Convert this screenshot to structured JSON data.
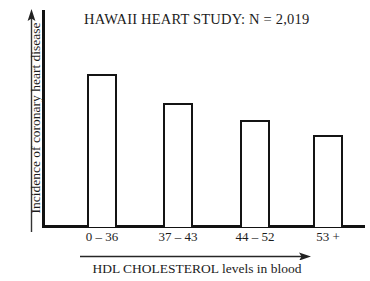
{
  "chart_data": {
    "type": "bar",
    "title": "HAWAII HEART STUDY: N  =  2,019",
    "xlabel": "HDL CHOLESTEROL levels in blood",
    "ylabel": "Incidence of coronary heart disease",
    "categories": [
      "0 – 36",
      "37 – 43",
      "44 – 52",
      "53 +"
    ],
    "values": [
      153,
      124,
      107,
      92
    ],
    "value_unit": "relative incidence (unlabeled axis)",
    "ylim": [
      0,
      218
    ],
    "grid": false,
    "legend": null,
    "y_axis_ticks": [],
    "x_axis_ticks": [
      "0 – 36",
      "37 – 43",
      "44 – 52",
      "53 +"
    ],
    "annotations": [
      "y-axis drawn as an upward arrow (increasing incidence)",
      "x-axis caption underlined by a right-pointing arrow (increasing HDL)"
    ],
    "bar_style": {
      "fill": "#ffffff",
      "stroke": "#141414",
      "stroke_width": 2,
      "bar_width_px": 30
    },
    "bars": [
      {
        "category": "0 – 36",
        "value": 153,
        "x": 87,
        "top": 74,
        "width": 30,
        "height": 153
      },
      {
        "category": "37 – 43",
        "value": 124,
        "x": 163,
        "top": 103,
        "width": 30,
        "height": 124
      },
      {
        "category": "44 – 52",
        "value": 107,
        "x": 240,
        "top": 120,
        "width": 30,
        "height": 107
      },
      {
        "category": "53 +",
        "value": 92,
        "x": 313,
        "top": 135,
        "width": 30,
        "height": 92
      }
    ]
  },
  "colors": {
    "background": "#ffffff",
    "ink": "#1a1a1a",
    "axis": "#121212",
    "bar_stroke": "#141414"
  }
}
